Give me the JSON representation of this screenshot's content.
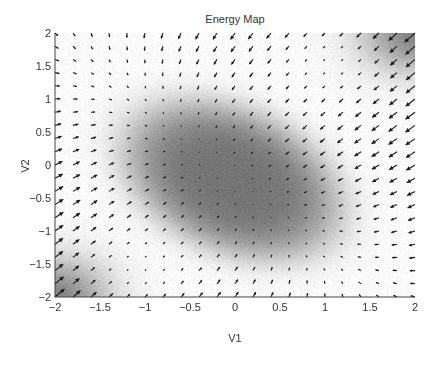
{
  "chart_data": {
    "type": "heatmap",
    "subtype": "quiver-over-energy-map",
    "title": "Energy Map",
    "xlabel": "V1",
    "ylabel": "V2",
    "xlim": [
      -2,
      2
    ],
    "ylim": [
      -2,
      2
    ],
    "xticks": [
      -2,
      -1.5,
      -1,
      -0.5,
      0,
      0.5,
      1,
      1.5,
      2
    ],
    "yticks": [
      -2,
      -1.5,
      -1,
      -0.5,
      0,
      0.5,
      1,
      1.5,
      2
    ],
    "xtick_labels": [
      "-2",
      "-1.5",
      "-1",
      "-0.5",
      "0",
      "0.5",
      "1",
      "1.5",
      "2"
    ],
    "ytick_labels": [
      "-2",
      "-1.5",
      "-1",
      "-0.5",
      "0",
      "0.5",
      "1",
      "1.5",
      "2"
    ],
    "grid": false,
    "colormap": "gray",
    "quiver_grid": {
      "x_start": -2,
      "x_end": 2,
      "y_start": -2,
      "y_end": 2,
      "count": 21
    },
    "energy_minimum": {
      "center": [
        -0.03,
        -0.23
      ],
      "extent_x": [
        -1.37,
        1.33
      ],
      "extent_y": [
        -1.64,
        1.29
      ],
      "orientation": "major axis from upper-left to lower-right"
    },
    "low_energy_corners": [
      [
        2,
        2
      ],
      [
        -2,
        -2
      ]
    ],
    "weak_flow_regions": [
      [
        1.1,
        1.6
      ],
      [
        -1.1,
        -1.6
      ]
    ],
    "flow_direction": "arrows point toward the central low-energy region"
  }
}
